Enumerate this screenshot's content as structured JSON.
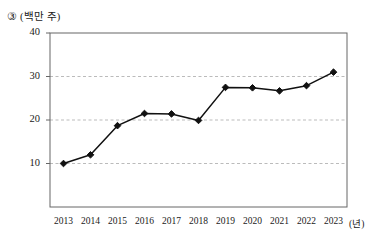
{
  "figure": {
    "item_marker": "③",
    "unit_label": "(백만 주)",
    "x_axis_unit": "(년)"
  },
  "chart_data": {
    "type": "line",
    "title": "",
    "subtitle": "",
    "xlabel": "(년)",
    "ylabel": "(백만 주)",
    "categories": [
      "2013",
      "2014",
      "2015",
      "2016",
      "2017",
      "2018",
      "2019",
      "2020",
      "2021",
      "2022",
      "2023"
    ],
    "values": [
      10.0,
      12.0,
      18.7,
      21.5,
      21.4,
      19.9,
      27.5,
      27.4,
      26.7,
      27.9,
      31.0
    ],
    "series": [
      {
        "name": "주식 수",
        "values": [
          10.0,
          12.0,
          18.7,
          21.5,
          21.4,
          19.9,
          27.5,
          27.4,
          26.7,
          27.9,
          31.0
        ]
      }
    ],
    "ylim": [
      0,
      40
    ],
    "yticks": [
      10,
      20,
      30,
      40
    ],
    "ytick_labels": [
      "10",
      "20",
      "30",
      "40"
    ],
    "xtick_labels": [
      "2013",
      "2014",
      "2015",
      "2016",
      "2017",
      "2018",
      "2019",
      "2020",
      "2021",
      "2022",
      "2023"
    ],
    "grid": true,
    "grid_axis": "y",
    "grid_style": "dashed",
    "legend": false,
    "legend_position": "none",
    "marker": "diamond",
    "line_color": "#111111",
    "marker_color": "#111111",
    "grid_color": "#bbbbbb",
    "frame_color": "#666666",
    "annotations": []
  }
}
